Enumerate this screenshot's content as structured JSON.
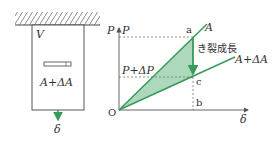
{
  "specimen": {
    "volume_label": "V",
    "area_label": "A+ΔA",
    "displacement_label": "δ"
  },
  "graph": {
    "y_axis_label": "P",
    "y_tick_P": "P",
    "y_tick_P_dP": "P+ΔP",
    "x_axis_label": "δ",
    "origin_label": "O",
    "point_a": "a",
    "point_b": "b",
    "point_c": "c",
    "line_A_label": "A",
    "line_AdA_label": "A+ΔA",
    "crack_growth_label": "き裂成長"
  },
  "colors": {
    "green": "#3a9a5a",
    "fill": "#9fd1b0",
    "ink": "#444444"
  }
}
